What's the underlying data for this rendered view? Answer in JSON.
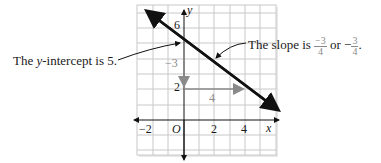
{
  "figure": {
    "left_annotation": "The y-intercept is 5.",
    "left_annotation_parts": {
      "pre": "The ",
      "var": "y",
      "post": "-intercept is 5."
    },
    "right_annotation": {
      "pre": "The slope is ",
      "frac1_num": "−3",
      "frac1_den": "4",
      "mid": " or −",
      "frac2_num": "3",
      "frac2_den": "4",
      "post": "."
    },
    "rise_label": "−3",
    "run_label": "4",
    "axis": {
      "x_label": "x",
      "y_label": "y",
      "origin_label": "O",
      "x_ticks": [
        "−2",
        "2",
        "4"
      ],
      "y_ticks": [
        "6",
        "2"
      ]
    },
    "line": {
      "slope": -0.75,
      "intercept": 5
    },
    "colors": {
      "grid": "#c8c8c8",
      "line": "#111111",
      "helper": "#8a8a8a"
    }
  }
}
